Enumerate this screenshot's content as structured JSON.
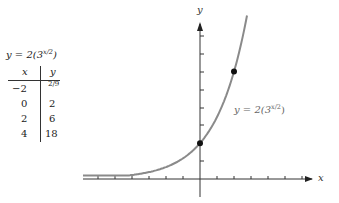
{
  "table": {
    "title_base": "y = 2(3",
    "title_exp": "x/2",
    "title_close": ")",
    "headers": {
      "x": "x",
      "y": "y"
    },
    "rows": [
      {
        "x": "−2",
        "y": "2/9"
      },
      {
        "x": "0",
        "y": "2"
      },
      {
        "x": "2",
        "y": "6"
      },
      {
        "x": "4",
        "y": "18"
      }
    ]
  },
  "graph": {
    "x_axis_label": "x",
    "y_axis_label": "y",
    "curve_label_base": "y = 2(3",
    "curve_label_exp": "x/2",
    "curve_label_close": ")",
    "curve_color": "#8a8a8a",
    "highlighted_points": [
      [
        0,
        2
      ],
      [
        2,
        6
      ]
    ]
  },
  "chart_data": {
    "type": "line",
    "title": "",
    "function": "y = 2(3^(x/2))",
    "series": [
      {
        "name": "y = 2(3^(x/2))",
        "x": [
          -2,
          0,
          2,
          4
        ],
        "y": [
          0.2222,
          2,
          6,
          18
        ]
      }
    ],
    "marked_points": [
      {
        "x": 0,
        "y": 2
      },
      {
        "x": 2,
        "y": 6
      }
    ],
    "xlabel": "x",
    "ylabel": "y",
    "xlim": [
      -7,
      6.5
    ],
    "ylim": [
      -1,
      9
    ],
    "grid": false,
    "tick_spacing": 1,
    "tick_labels": "none"
  }
}
